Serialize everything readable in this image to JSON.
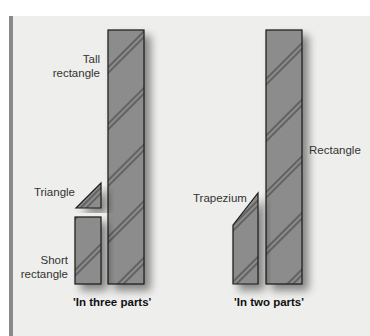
{
  "diagram": {
    "colors": {
      "panel_background": "#eeeeec",
      "panel_bar": "#8a8a8a",
      "shape_fill": "#8c8c8c",
      "shape_stroke": "#1a1a1a",
      "hatch": "#222222"
    },
    "groups": [
      {
        "caption": "'In three parts'",
        "shapes": [
          {
            "name": "tall-rectangle",
            "label_line1": "Tall",
            "label_line2": "rectangle"
          },
          {
            "name": "triangle",
            "label": "Triangle"
          },
          {
            "name": "short-rectangle",
            "label_line1": "Short",
            "label_line2": "rectangle"
          }
        ]
      },
      {
        "caption": "'In two parts'",
        "shapes": [
          {
            "name": "rectangle",
            "label": "Rectangle"
          },
          {
            "name": "trapezium",
            "label": "Trapezium"
          }
        ]
      }
    ]
  }
}
